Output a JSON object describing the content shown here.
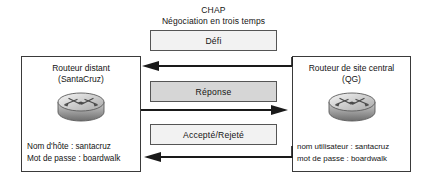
{
  "title": {
    "main": "CHAP",
    "sub": "Négociation en trois temps"
  },
  "routers": {
    "left": {
      "name": "Routeur distant",
      "qualifier": "(SantaCruz)",
      "icon": "router-icon",
      "creds": [
        "Nom d'hôte : santacruz",
        "Mot de passe : boardwalk"
      ]
    },
    "right": {
      "name": "Routeur de site central",
      "qualifier": "(QG)",
      "icon": "router-icon",
      "creds": [
        "nom utilisateur : santacruz",
        "mot de passe : boardwalk"
      ]
    }
  },
  "messages": [
    {
      "label": "Défi",
      "fill": "#f2f2f2",
      "direction": "right-to-left"
    },
    {
      "label": "Réponse",
      "fill": "#d6d6d6",
      "direction": "left-to-right"
    },
    {
      "label": "Accepté/Rejeté",
      "fill": "#f2f2f2",
      "direction": "right-to-left"
    }
  ],
  "colors": {
    "stroke": "#1a1a1a",
    "box_border": "#3a3a3a",
    "msg_border": "#555555",
    "background": "#ffffff"
  }
}
